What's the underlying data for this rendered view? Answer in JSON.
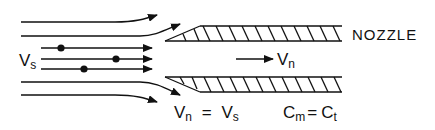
{
  "diagram": {
    "labels": {
      "nozzle": "NOZZLE",
      "stream_velocity": {
        "symbol": "V",
        "subscript": "s"
      },
      "nozzle_velocity": {
        "symbol": "V",
        "subscript": "n"
      },
      "velocity_equation": {
        "left_symbol": "V",
        "left_subscript": "n",
        "operator": "=",
        "right_symbol": "V",
        "right_subscript": "s"
      },
      "concentration_equation": {
        "left_symbol": "C",
        "left_subscript": "m",
        "operator": "=",
        "right_symbol": "C",
        "right_subscript": "t"
      }
    },
    "elements": {
      "streamlines": 4,
      "particle_paths": 3,
      "particles": 3,
      "nozzle_walls": 2
    },
    "colors": {
      "ink": "#111111",
      "background": "#ffffff"
    }
  }
}
